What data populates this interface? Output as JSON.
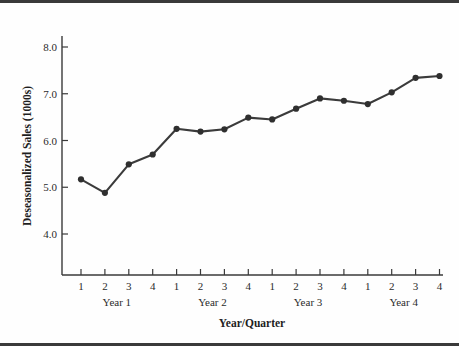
{
  "chart_data": {
    "type": "line",
    "title": "",
    "xlabel": "Year/Quarter",
    "ylabel": "Deseasonalized Sales (1000s)",
    "ylim": [
      3.4,
      8.45
    ],
    "yticks": [
      4.0,
      5.0,
      6.0,
      7.0,
      8.0
    ],
    "ytick_labels": [
      "4.0",
      "5.0",
      "6.0",
      "7.0",
      "8.0"
    ],
    "grid": false,
    "legend": "none",
    "marker": "filled-circle",
    "line_color": "#3b3b3b",
    "marker_color": "#2f2f2f",
    "x": [
      1,
      2,
      3,
      4,
      5,
      6,
      7,
      8,
      9,
      10,
      11,
      12,
      13,
      14,
      15,
      16
    ],
    "xtick_labels": [
      "1",
      "2",
      "3",
      "4",
      "1",
      "2",
      "3",
      "4",
      "1",
      "2",
      "3",
      "4",
      "1",
      "2",
      "3",
      "4"
    ],
    "group_labels": [
      "Year 1",
      "Year 2",
      "Year 3",
      "Year 4"
    ],
    "categories": [
      "Year 1 Q1",
      "Year 1 Q2",
      "Year 1 Q3",
      "Year 1 Q4",
      "Year 2 Q1",
      "Year 2 Q2",
      "Year 2 Q3",
      "Year 2 Q4",
      "Year 3 Q1",
      "Year 3 Q2",
      "Year 3 Q3",
      "Year 3 Q4",
      "Year 4 Q1",
      "Year 4 Q2",
      "Year 4 Q3",
      "Year 4 Q4"
    ],
    "values": [
      5.17,
      4.88,
      5.49,
      5.7,
      6.25,
      6.19,
      6.24,
      6.49,
      6.45,
      6.68,
      6.9,
      6.85,
      6.78,
      7.03,
      7.34,
      7.38
    ]
  }
}
